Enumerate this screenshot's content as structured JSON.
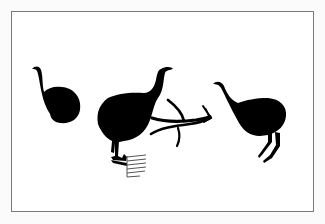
{
  "figure": {
    "background": "#fbfbfb",
    "panel_background": "#ffffff",
    "frame_color": "#7a7a7a",
    "ink_color": "#000000",
    "figures": [
      {
        "name": "bird-left",
        "note": "small bird, round body, curved neck"
      },
      {
        "name": "bird-center",
        "note": "large bird with legs and comb glyph below"
      },
      {
        "name": "branch-motif",
        "note": "forked branch/limb ending in a flared tip"
      },
      {
        "name": "bird-right",
        "note": "bird with long neck and two thin legs"
      }
    ]
  }
}
